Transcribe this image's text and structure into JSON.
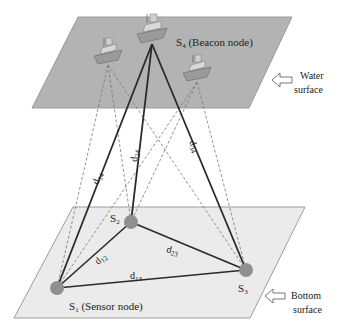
{
  "colors": {
    "water_fill": "#b3b3b3",
    "water_stroke": "#9a9a9a",
    "bottom_fill": "#ebebeb",
    "bottom_stroke": "#9c9c9c",
    "solid_line": "#2a2a2a",
    "dashed_line": "#777777",
    "node_fill": "#8f8f8f"
  },
  "surfaces": {
    "water": {
      "label_line1": "Water",
      "label_line2": "surface"
    },
    "bottom": {
      "label_line1": "Bottom",
      "label_line2": "surface"
    }
  },
  "nodes": {
    "s1": {
      "name": "S",
      "sub": "1",
      "desc": " (Sensor node)"
    },
    "s2": {
      "name": "S",
      "sub": "2"
    },
    "s3": {
      "name": "S",
      "sub": "3"
    },
    "s4": {
      "name": "S",
      "sub": "4",
      "desc": " (Beacon node)"
    }
  },
  "distances": {
    "d14": {
      "d": "d",
      "sub": "14"
    },
    "d24": {
      "d": "d",
      "sub": "24"
    },
    "d34": {
      "d": "d",
      "sub": "34"
    },
    "d12": {
      "d": "d",
      "sub": "12"
    },
    "d13": {
      "d": "d",
      "sub": "13"
    },
    "d23": {
      "d": "d",
      "sub": "23"
    }
  }
}
